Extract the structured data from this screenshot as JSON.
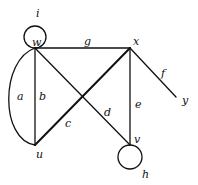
{
  "graph": {
    "vertices": {
      "w": "w",
      "x": "x",
      "y": "y",
      "u": "u",
      "v": "v"
    },
    "edges": {
      "a": "a",
      "b": "b",
      "c": "c",
      "d": "d",
      "e": "e",
      "f": "f",
      "g": "g",
      "h": "h",
      "i": "i"
    },
    "edge_list": [
      {
        "label": "a",
        "from": "w",
        "to": "u",
        "type": "curved"
      },
      {
        "label": "b",
        "from": "w",
        "to": "u",
        "type": "straight"
      },
      {
        "label": "c",
        "from": "u",
        "to": "x",
        "type": "straight"
      },
      {
        "label": "d",
        "from": "w",
        "to": "v",
        "type": "straight"
      },
      {
        "label": "e",
        "from": "x",
        "to": "v",
        "type": "straight"
      },
      {
        "label": "f",
        "from": "x",
        "to": "y",
        "type": "straight"
      },
      {
        "label": "g",
        "from": "w",
        "to": "x",
        "type": "straight"
      },
      {
        "label": "h",
        "from": "v",
        "to": "v",
        "type": "loop"
      },
      {
        "label": "i",
        "from": "w",
        "to": "w",
        "type": "loop"
      }
    ],
    "colors": {
      "stroke": "#111111",
      "background": "#ffffff"
    }
  }
}
